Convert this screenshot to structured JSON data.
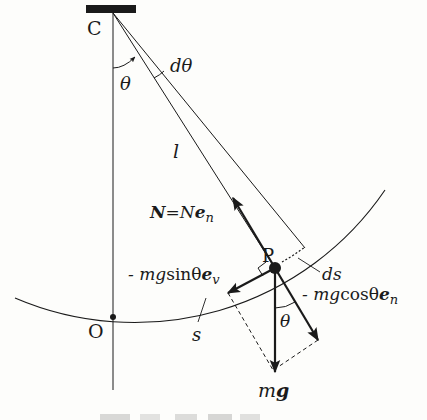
{
  "diagram": {
    "labels": {
      "pivot": "C",
      "origin": "O",
      "bob": "P",
      "angle_theta": "θ",
      "angle_dtheta": "dθ",
      "length": "l",
      "arc_length": "s",
      "arc_element": "ds",
      "normal_force_bold": "N",
      "normal_force_eq": "=",
      "normal_force_N": "N",
      "normal_force_e": "e",
      "normal_force_sub": "n",
      "tangential_prefix": "- mg",
      "tangential_trig": "sinθ",
      "tangential_e": "e",
      "tangential_sub": "v",
      "normal_comp_prefix": "- mg",
      "normal_comp_trig": "cosθ",
      "normal_comp_e": "e",
      "normal_comp_sub": "n",
      "angle_theta_lower": "θ",
      "gravity_m": "m",
      "gravity_g": "g"
    },
    "colors": {
      "ink": "#1a1a1a",
      "background": "#fdfdfb"
    }
  }
}
